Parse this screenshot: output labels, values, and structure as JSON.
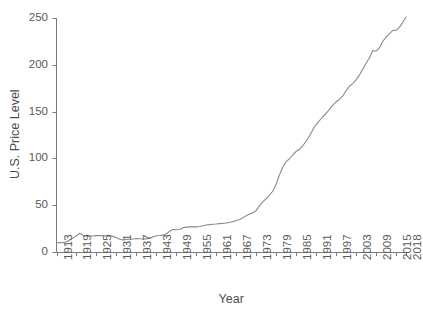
{
  "chart_data": {
    "type": "line",
    "title": "",
    "xlabel": "Year",
    "ylabel": "U.S. Price Level",
    "xlim": [
      1913,
      2018
    ],
    "ylim": [
      0,
      250
    ],
    "grid": false,
    "legend": "none",
    "line_color": "#8a8a8a",
    "axis_color": "#7a7a7a",
    "text_color": "#595959",
    "ytick_labels": [
      "0",
      "50",
      "100",
      "150",
      "200",
      "250"
    ],
    "ytick_values": [
      0,
      50,
      100,
      150,
      200,
      250
    ],
    "xtick_labels": [
      "1913",
      "1919",
      "1925",
      "1931",
      "1937",
      "1943",
      "1949",
      "1955",
      "1961",
      "1967",
      "1973",
      "1979",
      "1985",
      "1991",
      "1997",
      "2003",
      "2009",
      "2015",
      "2018"
    ],
    "xtick_values": [
      1913,
      1919,
      1925,
      1931,
      1937,
      1943,
      1949,
      1955,
      1961,
      1967,
      1973,
      1979,
      1985,
      1991,
      1997,
      2003,
      2009,
      2015,
      2018
    ],
    "series": [
      {
        "name": "U.S. Price Level",
        "x": [
          1913,
          1914,
          1915,
          1916,
          1917,
          1918,
          1919,
          1920,
          1921,
          1922,
          1923,
          1924,
          1925,
          1926,
          1927,
          1928,
          1929,
          1930,
          1931,
          1932,
          1933,
          1934,
          1935,
          1936,
          1937,
          1938,
          1939,
          1940,
          1941,
          1942,
          1943,
          1944,
          1945,
          1946,
          1947,
          1948,
          1949,
          1950,
          1951,
          1952,
          1953,
          1954,
          1955,
          1956,
          1957,
          1958,
          1959,
          1960,
          1961,
          1962,
          1963,
          1964,
          1965,
          1966,
          1967,
          1968,
          1969,
          1970,
          1971,
          1972,
          1973,
          1974,
          1975,
          1976,
          1977,
          1978,
          1979,
          1980,
          1981,
          1982,
          1983,
          1984,
          1985,
          1986,
          1987,
          1988,
          1989,
          1990,
          1991,
          1992,
          1993,
          1994,
          1995,
          1996,
          1997,
          1998,
          1999,
          2000,
          2001,
          2002,
          2003,
          2004,
          2005,
          2006,
          2007,
          2008,
          2009,
          2010,
          2011,
          2012,
          2013,
          2014,
          2015,
          2016,
          2017,
          2018
        ],
        "values": [
          9.9,
          10.0,
          10.1,
          10.9,
          12.8,
          15.1,
          17.3,
          20.0,
          17.9,
          16.8,
          17.1,
          17.1,
          17.5,
          17.7,
          17.4,
          17.2,
          17.2,
          16.7,
          15.2,
          13.6,
          12.9,
          13.4,
          13.7,
          13.9,
          14.4,
          14.1,
          13.9,
          14.0,
          14.7,
          16.3,
          17.3,
          17.6,
          18.0,
          19.5,
          22.3,
          24.0,
          23.8,
          24.1,
          26.0,
          26.6,
          26.8,
          26.9,
          26.8,
          27.2,
          28.1,
          28.9,
          29.2,
          29.6,
          29.9,
          30.3,
          30.6,
          31.0,
          31.5,
          32.5,
          33.4,
          34.8,
          36.7,
          38.8,
          40.5,
          41.8,
          44.4,
          49.3,
          53.8,
          56.9,
          60.6,
          65.2,
          72.6,
          82.4,
          90.9,
          96.5,
          99.6,
          103.9,
          107.6,
          109.6,
          113.6,
          118.3,
          124.0,
          130.7,
          136.2,
          140.3,
          144.5,
          148.2,
          152.4,
          156.9,
          160.5,
          163.0,
          166.6,
          172.2,
          177.1,
          179.9,
          184.0,
          188.9,
          195.3,
          201.6,
          207.3,
          215.3,
          214.5,
          218.1,
          224.9,
          229.6,
          233.0,
          236.7,
          237.0,
          240.0,
          245.1,
          251.1
        ]
      }
    ],
    "approx_end_value": 240
  }
}
